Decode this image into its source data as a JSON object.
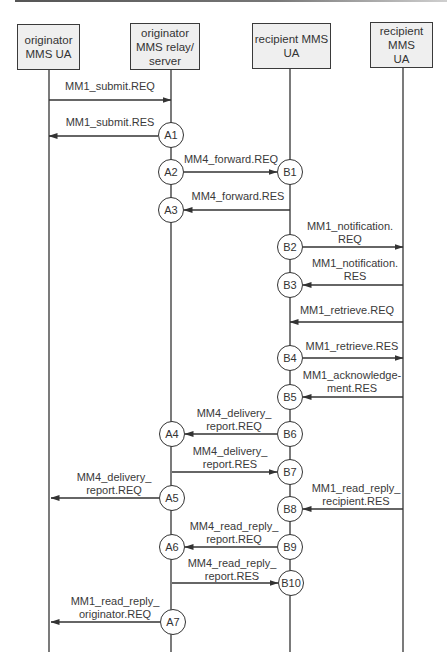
{
  "diagram": {
    "type": "sequence",
    "colors": {
      "line": "#333333",
      "box_fill": "#efefef",
      "text": "#333333"
    },
    "participants": [
      {
        "id": "p1",
        "label": "originator\nMMS UA",
        "x": 49,
        "box": [
          17,
          24,
          63,
          46
        ]
      },
      {
        "id": "p2",
        "label": "originator\nMMS relay/\nserver",
        "x": 171,
        "box": [
          130,
          23,
          70,
          47
        ]
      },
      {
        "id": "p3",
        "label": "recipient MMS\nUA",
        "x": 290,
        "box": [
          252,
          23,
          79,
          46
        ]
      },
      {
        "id": "p4",
        "label": "recipient\nMMS\nUA",
        "x": 403,
        "box": [
          370,
          22,
          63,
          46
        ]
      }
    ],
    "nodes": [
      {
        "label": "A1",
        "x": 171,
        "y": 135
      },
      {
        "label": "A2",
        "x": 171,
        "y": 172
      },
      {
        "label": "A3",
        "x": 171,
        "y": 210
      },
      {
        "label": "B1",
        "x": 290,
        "y": 172
      },
      {
        "label": "B2",
        "x": 290,
        "y": 247
      },
      {
        "label": "B3",
        "x": 290,
        "y": 285
      },
      {
        "label": "B4",
        "x": 290,
        "y": 358
      },
      {
        "label": "B5",
        "x": 290,
        "y": 397
      },
      {
        "label": "B6",
        "x": 290,
        "y": 434
      },
      {
        "label": "A4",
        "x": 172,
        "y": 434
      },
      {
        "label": "B7",
        "x": 290,
        "y": 472
      },
      {
        "label": "A5",
        "x": 172,
        "y": 498
      },
      {
        "label": "B8",
        "x": 290,
        "y": 509
      },
      {
        "label": "A6",
        "x": 172,
        "y": 547
      },
      {
        "label": "B9",
        "x": 290,
        "y": 547
      },
      {
        "label": "B10",
        "x": 291,
        "y": 583
      },
      {
        "label": "A7",
        "x": 173,
        "y": 622
      }
    ],
    "messages": [
      {
        "label": "MM1_submit.REQ",
        "x1": 49,
        "x2": 171,
        "y": 100,
        "lx": 110,
        "ly": 80
      },
      {
        "label": "MM1_submit.RES",
        "x1": 158,
        "x2": 49,
        "y": 136,
        "lx": 110,
        "ly": 116
      },
      {
        "label": "MM4_forward.REQ",
        "x1": 184,
        "x2": 277,
        "y": 172,
        "lx": 231,
        "ly": 153
      },
      {
        "label": "MM4_forward.RES",
        "x1": 290,
        "x2": 184,
        "y": 210,
        "lx": 238,
        "ly": 190
      },
      {
        "label": "MM1_notification.\nREQ",
        "x1": 303,
        "x2": 403,
        "y": 247,
        "lx": 350,
        "ly": 220
      },
      {
        "label": "MM1_notification.\nRES",
        "x1": 403,
        "x2": 303,
        "y": 285,
        "lx": 355,
        "ly": 257
      },
      {
        "label": "MM1_retrieve.REQ",
        "x1": 403,
        "x2": 290,
        "y": 322,
        "lx": 347,
        "ly": 304
      },
      {
        "label": "MM1_retrieve.RES",
        "x1": 303,
        "x2": 403,
        "y": 358,
        "lx": 352,
        "ly": 340
      },
      {
        "label": "MM1_acknowledge-\nment.RES",
        "x1": 403,
        "x2": 303,
        "y": 397,
        "lx": 352,
        "ly": 369
      },
      {
        "label": "MM4_delivery_\nreport.REQ",
        "x1": 277,
        "x2": 185,
        "y": 434,
        "lx": 234,
        "ly": 407
      },
      {
        "label": "MM4_delivery_\nreport.RES",
        "x1": 172,
        "x2": 277,
        "y": 472,
        "lx": 230,
        "ly": 445
      },
      {
        "label": "MM4_delivery_\nreport.REQ",
        "x1": 159,
        "x2": 51,
        "y": 498,
        "lx": 114,
        "ly": 471
      },
      {
        "label": "MM1_read_reply_\nrecipient.RES",
        "x1": 403,
        "x2": 303,
        "y": 509,
        "lx": 356,
        "ly": 482
      },
      {
        "label": "MM4_read_reply_\nreport.REQ",
        "x1": 277,
        "x2": 185,
        "y": 547,
        "lx": 234,
        "ly": 520
      },
      {
        "label": "MM4_read_reply_\nreport.RES",
        "x1": 172,
        "x2": 278,
        "y": 583,
        "lx": 232,
        "ly": 557
      },
      {
        "label": "MM1_read_reply_\noriginator.REQ",
        "x1": 160,
        "x2": 51,
        "y": 622,
        "lx": 115,
        "ly": 595
      }
    ],
    "lifeline_end_y": 652
  }
}
